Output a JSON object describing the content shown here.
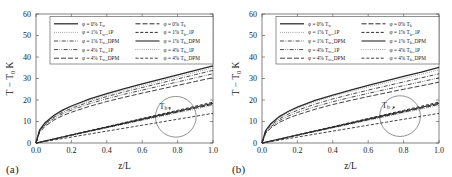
{
  "figure": {
    "panels": [
      {
        "id": "a",
        "label": "(a)",
        "label_name": "panel-label-a"
      },
      {
        "id": "b",
        "label": "(b)",
        "label_name": "panel-label-b"
      }
    ]
  },
  "chart_data": [
    {
      "type": "line",
      "panel": "a",
      "title": "",
      "xlabel": "z/L",
      "ylabel": "T − T₀ K",
      "xlim": [
        0.0,
        1.0
      ],
      "ylim": [
        0,
        60
      ],
      "xticks": [
        0.0,
        0.2,
        0.4,
        0.6,
        0.8,
        1.0
      ],
      "xticklabels": [
        "0.0",
        "0.2",
        "0.4",
        "0.6",
        "0.8",
        "1.0"
      ],
      "yticks": [
        0,
        10,
        20,
        30,
        40,
        50,
        60
      ],
      "yticklabels": [
        "0",
        "10",
        "20",
        "30",
        "40",
        "50",
        "60"
      ],
      "grid": false,
      "legend_position": "upper center",
      "annotations": [
        {
          "text": "Tᵇ",
          "text_plain": "Tb",
          "x": 0.72,
          "y": 16.0,
          "circle_x": 0.79,
          "circle_y": 12.2,
          "circle_r": 0.115
        }
      ],
      "x": [
        0.0,
        0.02,
        0.05,
        0.1,
        0.15,
        0.2,
        0.3,
        0.4,
        0.5,
        0.6,
        0.7,
        0.8,
        0.9,
        1.0
      ],
      "series": [
        {
          "name": "φ = 0% Tᵥ",
          "label": "φ = 0% T",
          "sub": "w",
          "suffix": "",
          "style": "solid",
          "width": 1.25,
          "column": "left",
          "values": [
            0.0,
            6.0,
            9.3,
            12.8,
            15.3,
            17.2,
            20.4,
            23.0,
            25.3,
            27.5,
            29.6,
            31.7,
            33.8,
            35.9
          ]
        },
        {
          "name": "φ = 1% Tᵥ 1P",
          "label": "φ = 1% T",
          "sub": "w",
          "suffix": "1P",
          "style": "dotted",
          "width": 0.7,
          "column": "left",
          "values": [
            0.0,
            5.8,
            9.0,
            12.4,
            14.8,
            16.7,
            19.8,
            22.3,
            24.6,
            26.7,
            28.8,
            30.8,
            32.9,
            35.0
          ]
        },
        {
          "name": "φ = 1% Tᵥ DPM",
          "label": "φ = 1% T",
          "sub": "w",
          "suffix": "DPM",
          "style": "dashdot",
          "width": 0.85,
          "column": "left",
          "values": [
            0.0,
            5.6,
            8.7,
            12.0,
            14.3,
            16.1,
            19.1,
            21.6,
            23.8,
            25.8,
            27.8,
            29.8,
            31.8,
            33.8
          ]
        },
        {
          "name": "φ = 4% Tᵥ 1P",
          "label": "φ = 4% T",
          "sub": "w",
          "suffix": "1P",
          "style": "dashdotdot",
          "width": 0.85,
          "column": "left",
          "values": [
            0.0,
            5.3,
            8.3,
            11.4,
            13.6,
            15.3,
            18.2,
            20.6,
            22.7,
            24.6,
            26.5,
            28.4,
            30.3,
            32.2
          ]
        },
        {
          "name": "φ = 4% Tᵥ DPM",
          "label": "φ = 4% T",
          "sub": "w",
          "suffix": "DPM",
          "style": "longdash",
          "width": 0.9,
          "column": "left",
          "values": [
            0.0,
            4.9,
            7.7,
            10.6,
            12.7,
            14.3,
            17.0,
            19.3,
            21.3,
            23.2,
            25.0,
            26.8,
            28.6,
            30.4
          ]
        },
        {
          "name": "φ = 0% Tᵇ",
          "label": "φ = 0% T",
          "sub": "b",
          "suffix": "",
          "style": "longdash",
          "width": 1.0,
          "column": "right",
          "values": [
            0.0,
            0.35,
            0.9,
            1.8,
            2.7,
            3.6,
            5.4,
            7.2,
            9.0,
            10.8,
            12.6,
            14.4,
            16.2,
            18.0
          ]
        },
        {
          "name": "φ = 1% Tᵇ 1P",
          "label": "φ = 1% T",
          "sub": "b",
          "suffix": "1P",
          "style": "dashed",
          "width": 1.0,
          "column": "right",
          "values": [
            0.0,
            0.37,
            0.95,
            1.9,
            2.85,
            3.8,
            5.7,
            7.6,
            9.5,
            11.4,
            13.3,
            15.2,
            17.1,
            19.0
          ]
        },
        {
          "name": "φ = 1% Tᵇ DPM",
          "label": "φ = 1% T",
          "sub": "b",
          "suffix": "DPM",
          "style": "solid",
          "width": 1.1,
          "column": "right",
          "values": [
            0.0,
            0.36,
            0.92,
            1.85,
            2.78,
            3.7,
            5.55,
            7.4,
            9.25,
            11.1,
            12.95,
            14.8,
            16.65,
            18.5
          ]
        },
        {
          "name": "φ = 4% Tᵇ 1P",
          "label": "φ = 4% T",
          "sub": "b",
          "suffix": "1P",
          "style": "dotted",
          "width": 0.7,
          "column": "right",
          "values": [
            0.0,
            0.34,
            0.88,
            1.75,
            2.63,
            3.5,
            5.25,
            7.0,
            8.75,
            10.5,
            12.25,
            14.0,
            15.75,
            17.5
          ]
        },
        {
          "name": "φ = 4% Tᵇ DPM",
          "label": "φ = 4% T",
          "sub": "b",
          "suffix": "DPM",
          "style": "dashed",
          "width": 0.9,
          "column": "right",
          "values": [
            0.0,
            0.27,
            0.69,
            1.38,
            2.07,
            2.76,
            4.14,
            5.52,
            6.9,
            8.28,
            9.66,
            11.04,
            12.42,
            13.8
          ]
        }
      ]
    },
    {
      "type": "line",
      "panel": "b",
      "title": "",
      "xlabel": "z/L",
      "ylabel": "T − T₀ K",
      "xlim": [
        0.0,
        1.0
      ],
      "ylim": [
        0,
        60
      ],
      "xticks": [
        0.0,
        0.2,
        0.4,
        0.6,
        0.8,
        1.0
      ],
      "xticklabels": [
        "0.0",
        "0.2",
        "0.4",
        "0.6",
        "0.8",
        "1.0"
      ],
      "yticks": [
        0,
        10,
        20,
        30,
        40,
        50,
        60
      ],
      "yticklabels": [
        "0",
        "10",
        "20",
        "30",
        "40",
        "50",
        "60"
      ],
      "grid": false,
      "legend_position": "upper center",
      "annotations": [
        {
          "text": "Tᵇ",
          "text_plain": "Tb",
          "x": 0.7,
          "y": 16.5,
          "circle_x": 0.78,
          "circle_y": 12.5,
          "circle_r": 0.115
        }
      ],
      "x": [
        0.0,
        0.02,
        0.05,
        0.1,
        0.15,
        0.2,
        0.3,
        0.4,
        0.5,
        0.6,
        0.7,
        0.8,
        0.9,
        1.0
      ],
      "series": [
        {
          "name": "φ = 0% Tᵥ",
          "label": "φ = 0% T",
          "sub": "w",
          "suffix": "",
          "style": "solid",
          "width": 1.25,
          "column": "left",
          "values": [
            0.0,
            5.7,
            9.0,
            12.4,
            14.8,
            16.7,
            19.8,
            22.3,
            24.6,
            26.8,
            28.9,
            31.0,
            33.0,
            35.2
          ]
        },
        {
          "name": "φ = 1% Tᵥ 1P",
          "label": "φ = 1% T",
          "sub": "w",
          "suffix": "1P",
          "style": "dotted",
          "width": 0.7,
          "column": "left",
          "values": [
            0.0,
            5.5,
            8.7,
            12.0,
            14.3,
            16.1,
            19.2,
            21.7,
            23.9,
            26.0,
            28.0,
            30.0,
            32.0,
            34.0
          ]
        },
        {
          "name": "φ = 1% Tᵥ DPM",
          "label": "φ = 1% T",
          "sub": "w",
          "suffix": "DPM",
          "style": "dashdot",
          "width": 0.85,
          "column": "left",
          "values": [
            0.0,
            5.2,
            8.2,
            11.3,
            13.5,
            15.2,
            18.1,
            20.5,
            22.6,
            24.6,
            26.5,
            28.4,
            30.3,
            32.2
          ]
        },
        {
          "name": "φ = 4% Tᵥ 1P",
          "label": "φ = 4% T",
          "sub": "w",
          "suffix": "1P",
          "style": "dashdotdot",
          "width": 0.85,
          "column": "left",
          "values": [
            0.0,
            4.8,
            7.6,
            10.5,
            12.6,
            14.2,
            16.9,
            19.2,
            21.2,
            23.1,
            24.9,
            26.7,
            28.5,
            30.3
          ]
        },
        {
          "name": "φ = 4% Tᵥ DPM",
          "label": "φ = 4% T",
          "sub": "w",
          "suffix": "DPM",
          "style": "longdash",
          "width": 0.9,
          "column": "left",
          "values": [
            0.0,
            4.4,
            7.0,
            9.7,
            11.6,
            13.1,
            15.7,
            17.9,
            19.8,
            21.6,
            23.3,
            25.0,
            26.6,
            28.3
          ]
        },
        {
          "name": "φ = 0% Tᵇ",
          "label": "φ = 0% T",
          "sub": "b",
          "suffix": "",
          "style": "longdash",
          "width": 1.0,
          "column": "right",
          "values": [
            0.0,
            0.35,
            0.9,
            1.8,
            2.7,
            3.6,
            5.4,
            7.2,
            9.0,
            10.8,
            12.6,
            14.4,
            16.2,
            18.0
          ]
        },
        {
          "name": "φ = 1% Tᵇ 1P",
          "label": "φ = 1% T",
          "sub": "b",
          "suffix": "1P",
          "style": "dashed",
          "width": 1.0,
          "column": "right",
          "values": [
            0.0,
            0.37,
            0.95,
            1.9,
            2.85,
            3.8,
            5.7,
            7.6,
            9.5,
            11.4,
            13.3,
            15.2,
            17.1,
            19.0
          ]
        },
        {
          "name": "φ = 1% Tᵇ DPM",
          "label": "φ = 1% T",
          "sub": "b",
          "suffix": "DPM",
          "style": "solid",
          "width": 1.1,
          "column": "right",
          "values": [
            0.0,
            0.36,
            0.92,
            1.85,
            2.78,
            3.7,
            5.55,
            7.4,
            9.25,
            11.1,
            12.95,
            14.8,
            16.65,
            18.5
          ]
        },
        {
          "name": "φ = 4% Tᵇ 1P",
          "label": "φ = 4% T",
          "sub": "b",
          "suffix": "1P",
          "style": "dotted",
          "width": 0.7,
          "column": "right",
          "values": [
            0.0,
            0.34,
            0.88,
            1.75,
            2.63,
            3.5,
            5.25,
            7.0,
            8.75,
            10.5,
            12.25,
            14.0,
            15.75,
            17.5
          ]
        },
        {
          "name": "φ = 4% Tᵇ DPM",
          "label": "φ = 4% T",
          "sub": "b",
          "suffix": "DPM",
          "style": "dashed",
          "width": 0.9,
          "column": "right",
          "values": [
            0.0,
            0.27,
            0.69,
            1.38,
            2.07,
            2.76,
            4.14,
            5.52,
            6.9,
            8.28,
            9.66,
            11.04,
            12.42,
            13.8
          ]
        }
      ]
    }
  ],
  "colors": {
    "line": "#2a2a2a",
    "axis": "#4a4a4a",
    "text": "#1a1a1a",
    "background": "#ffffff"
  }
}
